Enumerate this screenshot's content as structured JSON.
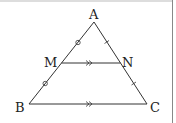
{
  "diagram": {
    "type": "geometry-triangle-midsegment",
    "points": {
      "A": {
        "label": "A",
        "x": 94,
        "y": 22
      },
      "B": {
        "label": "B",
        "x": 29,
        "y": 104
      },
      "C": {
        "label": "C",
        "x": 147,
        "y": 104
      },
      "M": {
        "label": "M",
        "x": 61.5,
        "y": 63
      },
      "N": {
        "label": "N",
        "x": 120.5,
        "y": 63
      }
    },
    "segments": [
      {
        "from": "A",
        "to": "B"
      },
      {
        "from": "A",
        "to": "C"
      },
      {
        "from": "B",
        "to": "C"
      },
      {
        "from": "M",
        "to": "N"
      }
    ],
    "marks": {
      "equal_circle": [
        "AM",
        "MB"
      ],
      "equal_tick": [
        "AN",
        "NC"
      ],
      "parallel_double_arrow": [
        "MN",
        "BC"
      ]
    },
    "colors": {
      "stroke": "#333333",
      "frame": "#888888",
      "background": "#ffffff"
    }
  }
}
